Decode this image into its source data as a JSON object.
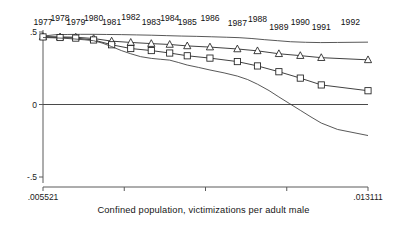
{
  "chart_data": {
    "type": "line",
    "title": "",
    "subtitle": "",
    "xlabel": "Confined population, victimizations per adult male",
    "ylabel": "",
    "xlim": [
      0.005521,
      0.013111
    ],
    "ylim": [
      -0.5,
      0.5
    ],
    "grid": false,
    "legend_position": "none",
    "x_tick_labels": [
      ".005521",
      ".013111"
    ],
    "x_tick_values": [
      0.005521,
      0.013111
    ],
    "x_minor_tick_count": 3,
    "y_tick_labels": [
      ".5",
      "0",
      "-.5"
    ],
    "y_tick_values": [
      0.5,
      0.0,
      -0.5
    ],
    "annotations": [
      {
        "label": "1977",
        "x": 0.005521,
        "y": 0.545
      },
      {
        "label": "1978",
        "x": 0.0059194,
        "y": 0.575
      },
      {
        "label": "1979",
        "x": 0.0062858,
        "y": 0.545
      },
      {
        "label": "1980",
        "x": 0.006703,
        "y": 0.578
      },
      {
        "label": "1981",
        "x": 0.007124,
        "y": 0.548
      },
      {
        "label": "1982",
        "x": 0.00757,
        "y": 0.58
      },
      {
        "label": "1983",
        "x": 0.00805,
        "y": 0.548
      },
      {
        "label": "1984",
        "x": 0.00848,
        "y": 0.578
      },
      {
        "label": "1985",
        "x": 0.00889,
        "y": 0.545
      },
      {
        "label": "1986",
        "x": 0.00942,
        "y": 0.575
      },
      {
        "label": "1987",
        "x": 0.01006,
        "y": 0.54
      },
      {
        "label": "1988",
        "x": 0.01053,
        "y": 0.57
      },
      {
        "label": "1989",
        "x": 0.01103,
        "y": 0.512
      },
      {
        "label": "1990",
        "x": 0.01153,
        "y": 0.545
      },
      {
        "label": "1991",
        "x": 0.01202,
        "y": 0.512
      },
      {
        "label": "1992",
        "x": 0.0127,
        "y": 0.545
      }
    ],
    "x": [
      0.005521,
      0.0059194,
      0.0062858,
      0.006703,
      0.007124,
      0.00757,
      0.00805,
      0.00848,
      0.00889,
      0.00942,
      0.01006,
      0.01053,
      0.01103,
      0.01153,
      0.01202,
      0.013111
    ],
    "series": [
      {
        "name": "upper-envelope",
        "marker": "none",
        "values": [
          0.472,
          0.48,
          0.482,
          0.484,
          0.483,
          0.481,
          0.478,
          0.474,
          0.47,
          0.468,
          0.462,
          0.452,
          0.438,
          0.43,
          0.428,
          0.43
        ]
      },
      {
        "name": "triangle-series",
        "marker": "triangle",
        "values": [
          0.468,
          0.466,
          0.464,
          0.455,
          0.437,
          0.428,
          0.42,
          0.414,
          0.404,
          0.396,
          0.383,
          0.37,
          0.35,
          0.337,
          0.323,
          0.308
        ]
      },
      {
        "name": "square-series",
        "marker": "square",
        "values": [
          0.466,
          0.462,
          0.458,
          0.445,
          0.412,
          0.386,
          0.372,
          0.355,
          0.336,
          0.32,
          0.296,
          0.266,
          0.226,
          0.182,
          0.135,
          0.095
        ]
      },
      {
        "name": "lower-envelope",
        "marker": "none",
        "values": [
          0.462,
          0.458,
          0.452,
          0.44,
          0.398,
          0.35,
          0.318,
          0.306,
          0.272,
          0.238,
          0.196,
          0.14,
          0.052,
          -0.04,
          -0.128,
          -0.214
        ]
      }
    ],
    "series_plot_values": {
      "lower_envelope_dense_x": [
        0.005521,
        0.00575,
        0.006,
        0.00625,
        0.0065,
        0.0067,
        0.0069,
        0.00712,
        0.00735,
        0.00757,
        0.0078,
        0.00805,
        0.00826,
        0.00848,
        0.00868,
        0.00889,
        0.00915,
        0.00942,
        0.00975,
        0.01006,
        0.0103,
        0.01053,
        0.0108,
        0.01103,
        0.01128,
        0.01153,
        0.01178,
        0.01202,
        0.0124,
        0.013111
      ],
      "lower_envelope_dense_y": [
        0.462,
        0.46,
        0.457,
        0.452,
        0.446,
        0.44,
        0.424,
        0.4,
        0.372,
        0.35,
        0.33,
        0.318,
        0.312,
        0.306,
        0.29,
        0.272,
        0.256,
        0.238,
        0.218,
        0.196,
        0.172,
        0.14,
        0.096,
        0.052,
        0.006,
        -0.04,
        -0.086,
        -0.128,
        -0.172,
        -0.214
      ],
      "upper_envelope_dense_x": [
        0.005521,
        0.0058,
        0.0061,
        0.0064,
        0.0067,
        0.007,
        0.00735,
        0.0077,
        0.00805,
        0.0084,
        0.00875,
        0.0091,
        0.00945,
        0.0098,
        0.0101,
        0.0104,
        0.0107,
        0.011,
        0.0113,
        0.01165,
        0.012,
        0.0124,
        0.013111
      ],
      "upper_envelope_dense_y": [
        0.472,
        0.481,
        0.483,
        0.484,
        0.484,
        0.483,
        0.482,
        0.48,
        0.478,
        0.475,
        0.472,
        0.47,
        0.467,
        0.464,
        0.461,
        0.455,
        0.447,
        0.44,
        0.433,
        0.429,
        0.427,
        0.428,
        0.43
      ]
    }
  },
  "figure": {
    "xaxis_title": "Confined population, victimizations per adult male"
  }
}
